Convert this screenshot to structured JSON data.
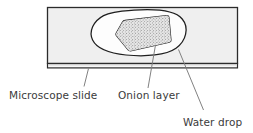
{
  "figure": {
    "type": "labelled-diagram"
  },
  "labels": [
    {
      "id": "microscope-slide",
      "text": "Microscope slide"
    },
    {
      "id": "onion-layer",
      "text": "Onion layer"
    },
    {
      "id": "water-drop",
      "text": "Water drop"
    }
  ],
  "parts": {
    "slide": {
      "name": "Microscope slide",
      "fill": "#efefef",
      "stroke": "#2b2b2b"
    },
    "water_drop": {
      "name": "Water drop",
      "fill": "#fdfdfd",
      "stroke": "#1f1f1f"
    },
    "onion_layer": {
      "name": "Onion layer",
      "fill": "#e3e3e3",
      "stroke": "#1f1f1f",
      "texture": "stipple"
    }
  },
  "colors": {
    "background": "#ffffff",
    "ink": "#1f1f1f",
    "text": "#3b3b3b",
    "leader": "#6a6a6a",
    "slide_fill": "#efefef",
    "drop_fill": "#fdfdfd",
    "onion_fill": "#e3e3e3"
  }
}
